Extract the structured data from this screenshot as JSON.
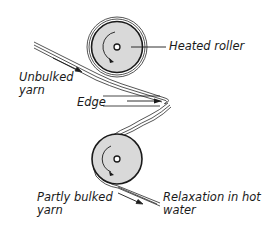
{
  "diagram": {
    "type": "yarn bulking process schematic",
    "colors": {
      "line": "#2a2a2a",
      "roller_fill": "#d9d9d9",
      "background": "#ffffff"
    },
    "components": {
      "upper_roller": {
        "name": "Heated roller",
        "center": [
          117,
          47
        ],
        "radius": 24
      },
      "lower_roller": {
        "name": "Roller",
        "center": [
          117,
          159
        ],
        "radius": 25
      },
      "edge": {
        "name": "Edge",
        "apex": [
          172,
          100
        ]
      }
    },
    "labels": {
      "heated_roller": "Heated roller",
      "unbulked_line1": "Unbulked",
      "unbulked_line2": "yarn",
      "edge": "Edge",
      "partly_bulked_line1": "Partly bulked",
      "partly_bulked_line2": "yarn",
      "relaxation_line1": "Relaxation in hot",
      "relaxation_line2": "water"
    }
  }
}
